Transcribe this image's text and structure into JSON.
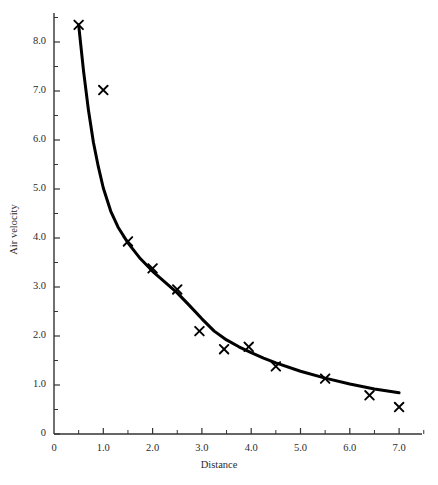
{
  "chart_data": {
    "type": "scatter",
    "title": "",
    "xlabel": "Distance",
    "ylabel": "Air velocity",
    "xlim": [
      0,
      7.6
    ],
    "ylim": [
      0,
      8.7
    ],
    "grid": false,
    "legend": null,
    "x_ticks": [
      0,
      1.0,
      2.0,
      3.0,
      4.0,
      5.0,
      6.0,
      7.0
    ],
    "x_tick_labels": [
      "0",
      "1.0",
      "2.0",
      "3.0",
      "4.0",
      "5.0",
      "6.0",
      "7.0"
    ],
    "x_minor_ticks": [
      0.5,
      1.5,
      2.5,
      3.5,
      4.5,
      5.5,
      6.5,
      7.5
    ],
    "y_ticks": [
      0,
      1.0,
      2.0,
      3.0,
      4.0,
      5.0,
      6.0,
      7.0,
      8.0
    ],
    "y_tick_labels": [
      "0",
      "1.0",
      "2.0",
      "3.0",
      "4.0",
      "5.0",
      "6.0",
      "7.0",
      "8.0"
    ],
    "y_minor_ticks": [
      0.5,
      1.5,
      2.5,
      3.5,
      4.5,
      5.5,
      6.5,
      7.5,
      8.5
    ],
    "marker": "x",
    "marker_color": "#000000",
    "line_color": "#000000",
    "series": [
      {
        "name": "measured",
        "type": "scatter",
        "points": [
          {
            "x": 0.5,
            "y": 8.35
          },
          {
            "x": 1.0,
            "y": 7.02
          },
          {
            "x": 1.5,
            "y": 3.93
          },
          {
            "x": 2.0,
            "y": 3.38
          },
          {
            "x": 2.5,
            "y": 2.95
          },
          {
            "x": 2.95,
            "y": 2.1
          },
          {
            "x": 3.45,
            "y": 1.73
          },
          {
            "x": 3.95,
            "y": 1.78
          },
          {
            "x": 4.5,
            "y": 1.38
          },
          {
            "x": 5.5,
            "y": 1.13
          },
          {
            "x": 6.4,
            "y": 0.79
          },
          {
            "x": 7.0,
            "y": 0.55
          }
        ]
      },
      {
        "name": "fitted curve",
        "type": "line",
        "points": [
          {
            "x": 0.5,
            "y": 8.35
          },
          {
            "x": 0.6,
            "y": 7.4
          },
          {
            "x": 0.7,
            "y": 6.6
          },
          {
            "x": 0.8,
            "y": 5.95
          },
          {
            "x": 0.9,
            "y": 5.45
          },
          {
            "x": 1.0,
            "y": 5.02
          },
          {
            "x": 1.15,
            "y": 4.55
          },
          {
            "x": 1.3,
            "y": 4.22
          },
          {
            "x": 1.5,
            "y": 3.9
          },
          {
            "x": 1.75,
            "y": 3.58
          },
          {
            "x": 2.0,
            "y": 3.32
          },
          {
            "x": 2.25,
            "y": 3.1
          },
          {
            "x": 2.5,
            "y": 2.88
          },
          {
            "x": 2.75,
            "y": 2.62
          },
          {
            "x": 3.0,
            "y": 2.35
          },
          {
            "x": 3.25,
            "y": 2.1
          },
          {
            "x": 3.5,
            "y": 1.92
          },
          {
            "x": 3.75,
            "y": 1.78
          },
          {
            "x": 4.0,
            "y": 1.66
          },
          {
            "x": 4.25,
            "y": 1.55
          },
          {
            "x": 4.5,
            "y": 1.45
          },
          {
            "x": 5.0,
            "y": 1.28
          },
          {
            "x": 5.5,
            "y": 1.14
          },
          {
            "x": 6.0,
            "y": 1.02
          },
          {
            "x": 6.5,
            "y": 0.92
          },
          {
            "x": 7.0,
            "y": 0.84
          }
        ]
      }
    ]
  },
  "axes": {
    "x_title": "Distance",
    "y_title": "Air velocity"
  }
}
